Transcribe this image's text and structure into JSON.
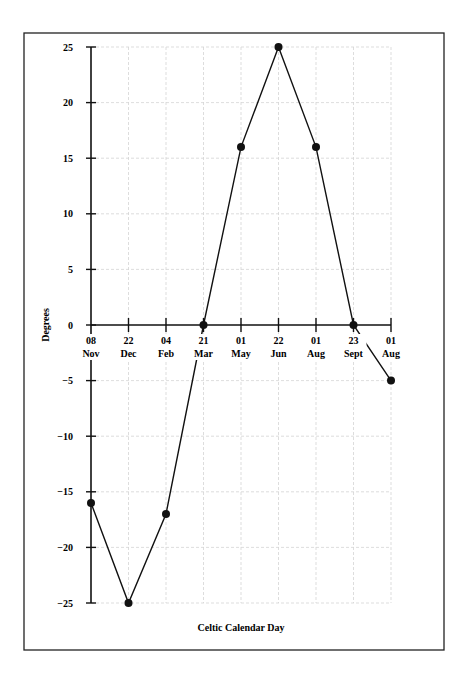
{
  "chart_data": {
    "type": "line",
    "title": "",
    "xlabel": "Celtic Calendar Day",
    "ylabel": "Degrees",
    "categories": [
      {
        "day": "08",
        "month": "Nov"
      },
      {
        "day": "22",
        "month": "Dec"
      },
      {
        "day": "04",
        "month": "Feb"
      },
      {
        "day": "21",
        "month": "Mar"
      },
      {
        "day": "01",
        "month": "May"
      },
      {
        "day": "22",
        "month": "Jun"
      },
      {
        "day": "01",
        "month": "Aug"
      },
      {
        "day": "23",
        "month": "Sept"
      },
      {
        "day": "01",
        "month": "Aug"
      }
    ],
    "series": [
      {
        "name": "Degrees",
        "values": [
          -16,
          -25,
          -17,
          0,
          16,
          25,
          16,
          0,
          -5
        ]
      }
    ],
    "yticks": [
      25,
      20,
      15,
      10,
      5,
      0,
      -5,
      -10,
      -15,
      -20,
      -25
    ],
    "ytick_labels": [
      "25",
      "20",
      "15",
      "10",
      "5",
      "0",
      "−5",
      "−10",
      "−15",
      "−20",
      "−25"
    ],
    "ylim": [
      -25,
      25
    ],
    "grid": true,
    "legend": "none",
    "marker": "filled-circle"
  }
}
